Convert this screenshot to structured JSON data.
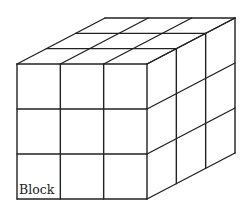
{
  "diagram": {
    "type": "3d-block-grid",
    "grid": {
      "columns": 3,
      "rows": 3,
      "depth": 3
    },
    "label": "Block",
    "stroke_color": "#222222",
    "background_color": "#ffffff"
  }
}
